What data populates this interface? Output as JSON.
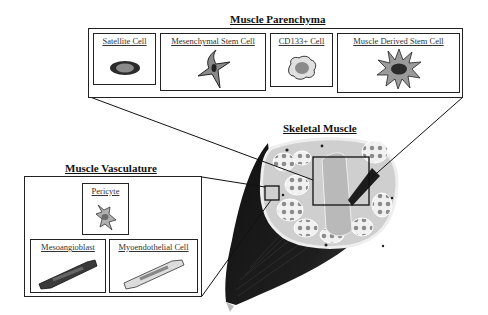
{
  "parenchyma": {
    "title": "Muscle Parenchyma",
    "cells": [
      {
        "label": "Satellite Cell",
        "icon": "oval-cell"
      },
      {
        "label": "Mesenchymal Stem Cell",
        "icon": "star-cell"
      },
      {
        "label": "CD133+ Cell",
        "icon": "round-blob-cell"
      },
      {
        "label": "Muscle Derived Stem Cell",
        "icon": "spiky-cell"
      }
    ]
  },
  "skeletal_muscle": {
    "title": "Skeletal Muscle"
  },
  "vasculature": {
    "title": "Muscle Vasculature",
    "cells": [
      {
        "label": "Pericyte",
        "icon": "pericyte-cell"
      },
      {
        "label": "Mesoangioblast",
        "icon": "dark-elongated-cell"
      },
      {
        "label": "Myoendothelial Cell",
        "icon": "light-elongated-cell"
      }
    ]
  },
  "colors": {
    "outline": "#222222",
    "dark_fill": "#2b2b2b",
    "mid_fill": "#8a8a8a",
    "light_fill": "#d9d9d9",
    "muscle_dark": "#1a1a1a",
    "cross_section": "#c8c8c8"
  }
}
